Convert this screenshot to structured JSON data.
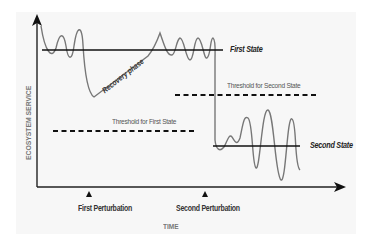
{
  "diagram": {
    "axes": {
      "x_label": "TIME",
      "y_label": "ECOSYSTEM SERVICE"
    },
    "states": {
      "first": "First State",
      "second": "Second State"
    },
    "thresholds": {
      "first": "Threshold for First State",
      "second": "Threshold for Second State"
    },
    "perturbations": {
      "first": "First Perturbation",
      "second": "Second Perturbation"
    },
    "annotations": {
      "recovery": "Recovery phase"
    },
    "colors": {
      "background_panel": "#f7f7f7",
      "axis": "#222222",
      "state_line": "#111111",
      "curve": "#777777",
      "threshold": "#111111"
    }
  }
}
